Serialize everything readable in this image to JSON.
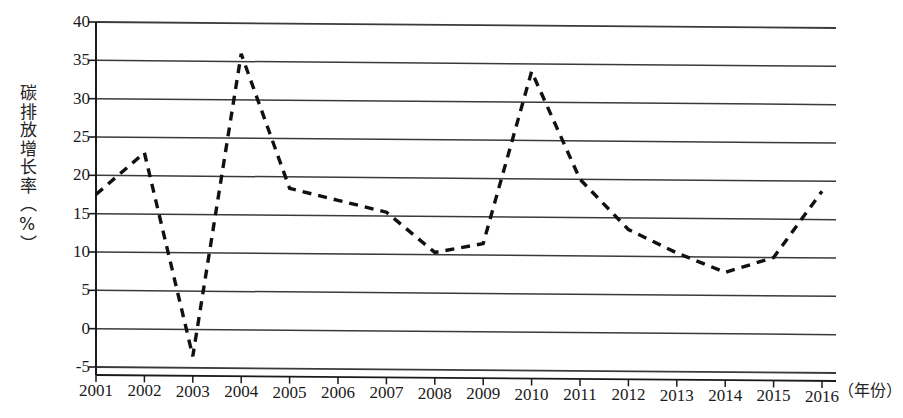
{
  "chart_data": {
    "type": "line",
    "title": "",
    "subtitle": "",
    "xlabel": "（年份）",
    "ylabel": "碳排放增长率（%）",
    "categories": [
      "2001",
      "2002",
      "2003",
      "2004",
      "2005",
      "2006",
      "2007",
      "2008",
      "2009",
      "2010",
      "2011",
      "2012",
      "2013",
      "2014",
      "2015",
      "2016"
    ],
    "values": [
      17.5,
      23.0,
      -3.5,
      36.0,
      18.5,
      17.0,
      15.5,
      10.3,
      11.5,
      34.0,
      20.0,
      13.5,
      10.5,
      8.0,
      10.0,
      18.7
    ],
    "series": [
      {
        "name": "碳排放增长率",
        "values": [
          17.5,
          23.0,
          -3.5,
          36.0,
          18.5,
          17.0,
          15.5,
          10.3,
          11.5,
          34.0,
          20.0,
          13.5,
          10.5,
          8.0,
          10.0,
          18.7
        ],
        "line_style": "dashed",
        "color": "#111111"
      }
    ],
    "ylim": [
      -5,
      40
    ],
    "ytick_step": 5,
    "yticks": [
      40,
      35,
      30,
      25,
      20,
      15,
      10,
      5,
      0,
      -5
    ],
    "ytick_labels": [
      "40",
      "35",
      "30",
      "25",
      "20",
      "15",
      "10",
      "5",
      "0",
      "-5"
    ],
    "xticks": [
      "2001",
      "2002",
      "2003",
      "2004",
      "2005",
      "2006",
      "2007",
      "2008",
      "2009",
      "2010",
      "2011",
      "2012",
      "2013",
      "2014",
      "2015",
      "2016"
    ],
    "grid": true,
    "grid_axis": "y",
    "legend": false,
    "legend_position": "none",
    "annotations": [],
    "colors": {
      "line": "#111111",
      "grid": "#3a3a3a",
      "axis": "#1a1a1a",
      "background": "#ffffff",
      "text": "#1a1a1a"
    }
  },
  "axis": {
    "y_title": "碳排放增长率（%）",
    "x_title": "（年份）"
  }
}
